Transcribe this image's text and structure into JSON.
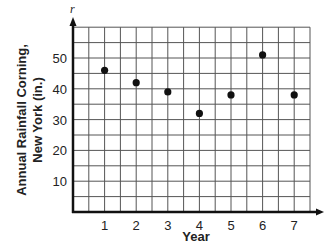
{
  "chart_data": {
    "type": "scatter",
    "title": "",
    "xlabel": "Year",
    "ylabel": "Annual Rainfall Corning, New York (in.)",
    "ylabel_lines": [
      "Annual Rainfall Corning,",
      "New York (in.)"
    ],
    "y_variable": "r",
    "x": [
      1,
      2,
      3,
      4,
      5,
      6,
      7
    ],
    "y": [
      46,
      42,
      39,
      32,
      38,
      51,
      38
    ],
    "x_ticks": [
      "1",
      "2",
      "3",
      "4",
      "5",
      "6",
      "7"
    ],
    "y_ticks": [
      "10",
      "20",
      "30",
      "40",
      "50"
    ],
    "xlim": [
      0,
      7.5
    ],
    "ylim": [
      0,
      60
    ],
    "grid": true,
    "grid_x_step": 0.5,
    "grid_y_step": 5,
    "legend": null,
    "marker_color": "#111111",
    "grid_color": "#555555",
    "axis_color": "#111111"
  }
}
